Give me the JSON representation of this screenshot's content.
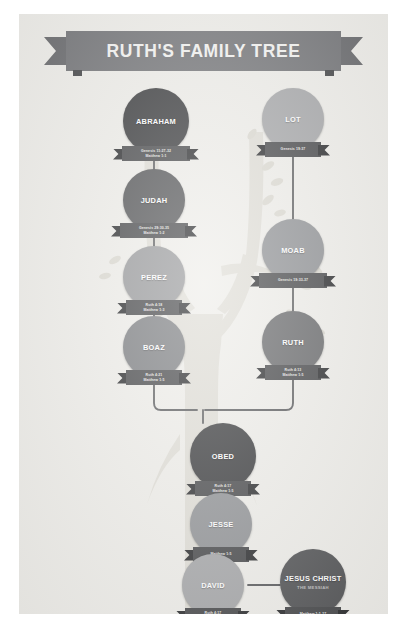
{
  "poster": {
    "title": "RUTH'S FAMILY TREE",
    "background_color": "#efeeea",
    "banner_color": "#77787b",
    "ribbon_color": "#4d4e50"
  },
  "chart_data": {
    "type": "diagram",
    "diagram_kind": "genealogy-family-tree",
    "title": "RUTH'S FAMILY TREE",
    "nodes": [
      {
        "id": "abraham",
        "label": "ABRAHAM",
        "subtitle": "",
        "refs": [
          "Genesis 11:27-32",
          "Matthew 1:1"
        ],
        "color": "#3f4042",
        "column": "left",
        "x": 104,
        "y": 74
      },
      {
        "id": "lot",
        "label": "LOT",
        "subtitle": "",
        "refs": [
          "Genesis 19:37"
        ],
        "color": "#a8a9ab",
        "column": "right",
        "x": 243,
        "y": 74
      },
      {
        "id": "judah",
        "label": "JUDAH",
        "subtitle": "",
        "refs": [
          "Genesis 29:30-35",
          "Matthew 1:2"
        ],
        "color": "#58595b",
        "column": "left",
        "x": 104,
        "y": 155
      },
      {
        "id": "moab",
        "label": "MOAB",
        "subtitle": "",
        "refs": [
          "Genesis 19:33-37"
        ],
        "color": "#939598",
        "column": "right",
        "x": 243,
        "y": 205
      },
      {
        "id": "perez",
        "label": "PEREZ",
        "subtitle": "",
        "refs": [
          "Ruth 4:18",
          "Matthew 1:3"
        ],
        "color": "#9b9c9e",
        "column": "left",
        "x": 104,
        "y": 232
      },
      {
        "id": "boaz",
        "label": "BOAZ",
        "subtitle": "",
        "refs": [
          "Ruth 4:21",
          "Matthew 1:5"
        ],
        "color": "#808285",
        "column": "left",
        "x": 104,
        "y": 302
      },
      {
        "id": "ruth",
        "label": "RUTH",
        "subtitle": "",
        "refs": [
          "Ruth 4:13",
          "Matthew 1:5"
        ],
        "color": "#6d6e70",
        "column": "right",
        "x": 243,
        "y": 297
      },
      {
        "id": "obed",
        "label": "OBED",
        "subtitle": "",
        "refs": [
          "Ruth 4:17",
          "Matthew 1:5"
        ],
        "color": "#3f4042",
        "column": "center",
        "x": 171,
        "y": 409
      },
      {
        "id": "jesse",
        "label": "JESSE",
        "subtitle": "",
        "refs": [
          "Matthew 1:5"
        ],
        "color": "#939598",
        "column": "center",
        "x": 171,
        "y": 479
      },
      {
        "id": "david",
        "label": "DAVID",
        "subtitle": "",
        "refs": [
          "Ruth 4:17",
          "Matthew 1:6"
        ],
        "color": "#a8a9ab",
        "column": "center",
        "x": 163,
        "y": 540
      },
      {
        "id": "jesus",
        "label": "JESUS CHRIST",
        "subtitle": "THE MESSIAH",
        "refs": [
          "Matthew 1:1-17"
        ],
        "color": "#58595b",
        "column": "right",
        "x": 261,
        "y": 535
      }
    ],
    "edges": [
      {
        "from": "abraham",
        "to": "judah"
      },
      {
        "from": "judah",
        "to": "perez"
      },
      {
        "from": "perez",
        "to": "boaz"
      },
      {
        "from": "lot",
        "to": "moab"
      },
      {
        "from": "moab",
        "to": "ruth"
      },
      {
        "from": "boaz",
        "to": "obed"
      },
      {
        "from": "ruth",
        "to": "obed"
      },
      {
        "from": "obed",
        "to": "jesse"
      },
      {
        "from": "jesse",
        "to": "david"
      },
      {
        "from": "david",
        "to": "jesus"
      }
    ],
    "lineages": {
      "left": [
        "ABRAHAM",
        "JUDAH",
        "PEREZ",
        "BOAZ"
      ],
      "right": [
        "LOT",
        "MOAB",
        "RUTH"
      ],
      "merged": [
        "OBED",
        "JESSE",
        "DAVID",
        "JESUS CHRIST"
      ]
    }
  }
}
